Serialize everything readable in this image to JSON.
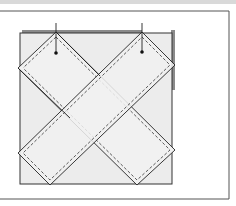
{
  "diagram": {
    "title": "",
    "colors": {
      "background": "#ffffff",
      "topbar": "#d9d9d9",
      "frame": "#555555",
      "base_fill": "#ececec",
      "base_outline": "#333333",
      "shadow_edge": "#8a8a8a",
      "strip_fill": "#f1f1f1",
      "strip_outline": "#222222",
      "stitch": "#333333",
      "pin": "#111111"
    },
    "elements": [
      {
        "name": "base-square",
        "type": "square"
      },
      {
        "name": "strip-left-to-right",
        "type": "diagonal-strip"
      },
      {
        "name": "strip-right-to-left",
        "type": "diagonal-strip"
      },
      {
        "name": "pin-left",
        "type": "pin"
      },
      {
        "name": "pin-right",
        "type": "pin"
      }
    ]
  }
}
